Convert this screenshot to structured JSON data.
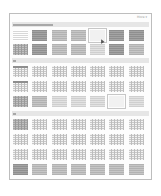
{
  "gallery": {
    "title": "Table Styles",
    "more_label": "More ▾",
    "sections": [
      {
        "label": "Plain Tables",
        "rows": [
          [
            "plain",
            "dark",
            "mid",
            "mid",
            "grid-hover",
            "dark",
            "dark"
          ],
          [
            "gridd",
            "dark",
            "mid",
            "mid",
            "light",
            "dark",
            "mid"
          ]
        ]
      },
      {
        "label": "Grid Tables",
        "rows": [
          [
            "grid-head",
            "grid",
            "grid",
            "grid",
            "grid",
            "grid",
            "grid"
          ],
          [
            "grid-head",
            "grid",
            "grid",
            "grid",
            "grid",
            "grid",
            "grid"
          ],
          [
            "gridd",
            "mid",
            "light",
            "light",
            "light",
            "light-selected",
            "light"
          ]
        ]
      },
      {
        "label": "List Tables",
        "rows": [
          [
            "gridd",
            "grid",
            "grid",
            "grid",
            "grid",
            "grid",
            "grid"
          ],
          [
            "grid",
            "grid",
            "grid",
            "grid",
            "grid",
            "grid",
            "grid"
          ],
          [
            "grid",
            "grid",
            "grid",
            "grid",
            "grid",
            "grid",
            "grid"
          ],
          [
            "dark",
            "mid",
            "mid",
            "mid",
            "mid",
            "mid",
            "mid"
          ]
        ]
      }
    ],
    "hovered_style": {
      "section": 0,
      "row": 0,
      "col": 4
    }
  }
}
